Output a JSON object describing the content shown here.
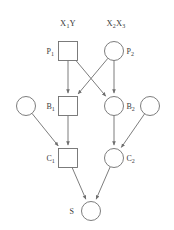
{
  "figure": {
    "background": "#ffffff",
    "stroke_color": "#6e6e6e",
    "text_color": "#3a3a3a",
    "width": 174,
    "height": 230
  },
  "headers": [
    {
      "id": "header-x1y",
      "text": "X",
      "sub": "1",
      "tail": "Y",
      "x": 68,
      "y": 18
    },
    {
      "id": "header-x2x3",
      "text": "X",
      "sub": "2",
      "tail": "X",
      "tail_sub": "3",
      "x": 116,
      "y": 18
    }
  ],
  "nodes": [
    {
      "id": "p1",
      "shape": "square",
      "cx": 68,
      "cy": 51,
      "size": 19,
      "label": "P",
      "sub": "1",
      "label_side": "left"
    },
    {
      "id": "p2",
      "shape": "circle",
      "cx": 114,
      "cy": 51,
      "size": 19,
      "label": "P",
      "sub": "2",
      "label_side": "right"
    },
    {
      "id": "b0",
      "shape": "circle",
      "cx": 26,
      "cy": 106,
      "size": 19,
      "label": "",
      "sub": "",
      "label_side": "none"
    },
    {
      "id": "b1",
      "shape": "square",
      "cx": 68,
      "cy": 106,
      "size": 19,
      "label": "B",
      "sub": "1",
      "label_side": "left"
    },
    {
      "id": "b2",
      "shape": "circle",
      "cx": 114,
      "cy": 106,
      "size": 19,
      "label": "B",
      "sub": "2",
      "label_side": "right"
    },
    {
      "id": "b3",
      "shape": "circle",
      "cx": 150,
      "cy": 106,
      "size": 19,
      "label": "",
      "sub": "",
      "label_side": "none"
    },
    {
      "id": "c1",
      "shape": "square",
      "cx": 68,
      "cy": 158,
      "size": 19,
      "label": "C",
      "sub": "1",
      "label_side": "left"
    },
    {
      "id": "c2",
      "shape": "circle",
      "cx": 114,
      "cy": 158,
      "size": 19,
      "label": "C",
      "sub": "2",
      "label_side": "right"
    },
    {
      "id": "s",
      "shape": "circle",
      "cx": 91,
      "cy": 211,
      "size": 19,
      "label": "S",
      "sub": "",
      "label_side": "left"
    }
  ],
  "edges": [
    {
      "id": "edge-p1-b1",
      "from": "p1",
      "to": "b1"
    },
    {
      "id": "edge-p1-b2",
      "from": "p1",
      "to": "b2"
    },
    {
      "id": "edge-p2-b1",
      "from": "p2",
      "to": "b1"
    },
    {
      "id": "edge-p2-b2",
      "from": "p2",
      "to": "b2"
    },
    {
      "id": "edge-b0-c1",
      "from": "b0",
      "to": "c1"
    },
    {
      "id": "edge-b1-c1",
      "from": "b1",
      "to": "c1"
    },
    {
      "id": "edge-b2-c2",
      "from": "b2",
      "to": "c2"
    },
    {
      "id": "edge-b3-c2",
      "from": "b3",
      "to": "c2"
    },
    {
      "id": "edge-c1-s",
      "from": "c1",
      "to": "s"
    },
    {
      "id": "edge-c2-s",
      "from": "c2",
      "to": "s"
    }
  ]
}
